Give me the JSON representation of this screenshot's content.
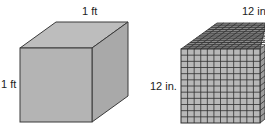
{
  "diagram": {
    "left_cube": {
      "top_label": "1 ft",
      "side_label": "1 ft",
      "colors": {
        "front": "#b4b4b4",
        "top": "#bdbdbd",
        "side": "#a9a9a9",
        "edge": "#3a3a3a"
      }
    },
    "right_cube": {
      "top_label": "12 in",
      "side_label": "12 in.",
      "grid_divisions": 12,
      "colors": {
        "front": "#b8b8b8",
        "top": "#8a8a8a",
        "side": "#9c9c9c",
        "grid": "#2e2e2e"
      }
    }
  }
}
